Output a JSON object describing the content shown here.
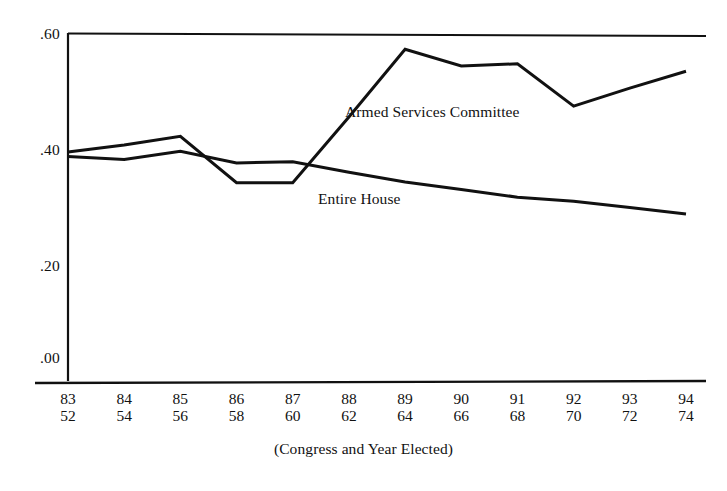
{
  "figure": {
    "axis_caption": "(Congress and Year Elected)"
  },
  "chart_data": {
    "type": "line",
    "title": "",
    "xlabel": "(Congress and Year Elected)",
    "ylabel": "",
    "grid": false,
    "legend": "inline-annotations",
    "ylim": [
      0.0,
      0.6
    ],
    "yticks": [
      0.0,
      0.2,
      0.4,
      0.6
    ],
    "ytick_labels": [
      ".00",
      ".20",
      ".40",
      ".60"
    ],
    "categories": [
      "83",
      "84",
      "85",
      "86",
      "87",
      "88",
      "89",
      "90",
      "91",
      "92",
      "93",
      "94"
    ],
    "x_sublabels": [
      "52",
      "54",
      "56",
      "58",
      "60",
      "62",
      "64",
      "66",
      "68",
      "70",
      "72",
      "74"
    ],
    "x_category_name": "Congress",
    "x_sublabel_name": "Year Elected",
    "series": [
      {
        "name": "Armed Services Committee",
        "values": [
          0.395,
          0.407,
          0.422,
          0.342,
          0.342,
          0.455,
          0.572,
          0.543,
          0.547,
          0.474,
          0.505,
          0.534
        ]
      },
      {
        "name": "Entire House",
        "values": [
          0.387,
          0.382,
          0.396,
          0.376,
          0.378,
          0.36,
          0.343,
          0.33,
          0.317,
          0.31,
          0.299,
          0.288
        ]
      }
    ]
  },
  "labels": {
    "armed_services": "Armed Services Committee",
    "entire_house": "Entire House"
  },
  "colors": {
    "line": "#111111",
    "axis": "#111111",
    "background": "#ffffff"
  }
}
